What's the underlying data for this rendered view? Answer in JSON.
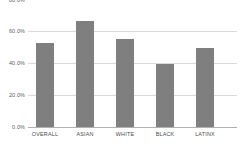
{
  "chart_data": {
    "type": "bar",
    "title": "",
    "subtitle": "",
    "xlabel": "",
    "ylabel": "",
    "categories": [
      "OVERALL",
      "ASIAN",
      "WHITE",
      "BLACK",
      "LATINX"
    ],
    "values": [
      52.8,
      66.3,
      54.7,
      39.4,
      49.4
    ],
    "series": [
      {
        "name": "",
        "values": [
          52.8,
          66.3,
          54.7,
          39.4,
          49.4
        ]
      }
    ],
    "ylim": [
      0,
      80
    ],
    "yticks": [
      0,
      20,
      40,
      60,
      80
    ],
    "ytick_labels": [
      "0.0%",
      "20.0%",
      "40.0%",
      "60.0%",
      "80.0%"
    ],
    "grid": true,
    "grid_axis": "y",
    "legend": false,
    "legend_position": "none",
    "bar_color": "#7f7f7f",
    "gridline_color": "#d9d9d9",
    "axis_color": "#b0b0b0",
    "tick_label_color": "#5a5a5a",
    "background_color": "#ffffff",
    "annotations": []
  },
  "caption": {
    "text": ""
  }
}
